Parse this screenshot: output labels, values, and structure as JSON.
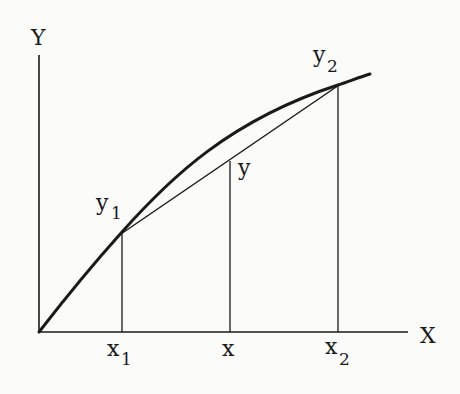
{
  "diagram": {
    "type": "linear-interpolation-figure",
    "axes": {
      "x_label": "X",
      "y_label": "Y"
    },
    "points": [
      {
        "name": "point-1",
        "x_label": "x",
        "x_sub": "1",
        "y_label": "y",
        "y_sub": "1"
      },
      {
        "name": "point-interp",
        "x_label": "x",
        "y_label": "y"
      },
      {
        "name": "point-2",
        "x_label": "x",
        "x_sub": "2",
        "y_label": "y",
        "y_sub": "2"
      }
    ],
    "elements": [
      "curve",
      "chord",
      "vertical-line-x1",
      "vertical-line-x",
      "vertical-line-x2"
    ],
    "colors": {
      "ink": "#1a1a1a",
      "background": "#fbfbfa"
    }
  }
}
